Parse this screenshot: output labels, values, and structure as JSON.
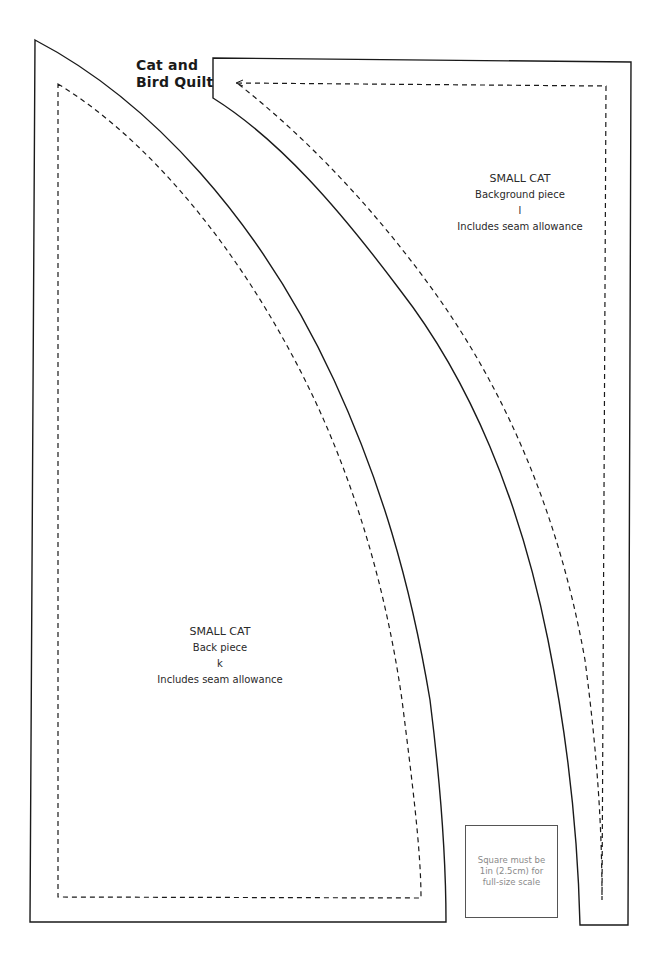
{
  "title": {
    "line1": "Cat and",
    "line2": "Bird Quilt"
  },
  "pieces": [
    {
      "name": "SMALL CAT",
      "piece": "Background piece",
      "letter": "l",
      "note": "Includes seam allowance"
    },
    {
      "name": "SMALL CAT",
      "piece": "Back piece",
      "letter": "k",
      "note": "Includes seam allowance"
    }
  ],
  "scale_box": {
    "line1": "Square must be",
    "line2": "1in (2.5cm) for",
    "line3": "full-size scale"
  },
  "colors": {
    "outline": "#1a1a1a",
    "seam": "#1a1a1a",
    "scale_text": "#8a8a8a"
  }
}
